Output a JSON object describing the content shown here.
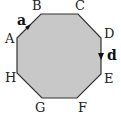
{
  "diagram": {
    "shape": "regular octagon",
    "fill_color": "#c8c8c8",
    "stroke_color": "#333333",
    "vertices": [
      {
        "label": "A",
        "x": 17,
        "y": 38
      },
      {
        "label": "B",
        "x": 41,
        "y": 14
      },
      {
        "label": "C",
        "x": 78,
        "y": 14
      },
      {
        "label": "D",
        "x": 101,
        "y": 38
      },
      {
        "label": "E",
        "x": 101,
        "y": 74
      },
      {
        "label": "F",
        "x": 77,
        "y": 98
      },
      {
        "label": "G",
        "x": 42,
        "y": 98
      },
      {
        "label": "H",
        "x": 17,
        "y": 73
      }
    ],
    "vectors": [
      {
        "label": "a",
        "from": "A",
        "to": "B"
      },
      {
        "label": "d",
        "from": "D",
        "to": "E"
      }
    ]
  }
}
